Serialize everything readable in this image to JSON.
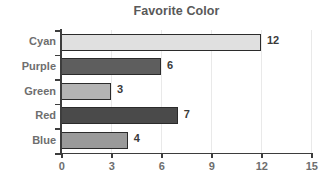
{
  "chart_data": {
    "type": "bar",
    "orientation": "horizontal",
    "title": "Favorite Color",
    "xlabel": "",
    "ylabel": "",
    "categories": [
      "Cyan",
      "Purple",
      "Green",
      "Red",
      "Blue"
    ],
    "values": [
      12,
      6,
      3,
      7,
      4
    ],
    "value_labels": [
      "12",
      "6",
      "3",
      "7",
      "4"
    ],
    "bar_colors": [
      "#e0e0e0",
      "#5e5e5e",
      "#b4b4b4",
      "#4a4a4a",
      "#9a9a9a"
    ],
    "bar_edge_color": "#2b2b2b",
    "xlim": [
      0,
      15
    ],
    "xticks": [
      0,
      3,
      6,
      9,
      12,
      15
    ],
    "xtick_labels": [
      "0",
      "3",
      "6",
      "9",
      "12",
      "15"
    ],
    "grid": true,
    "grid_axis": "x",
    "grid_color": "#e9e9e9",
    "legend": false,
    "background": "#ffffff",
    "title_color": "#595959",
    "tick_label_color": "#6e6e6e",
    "axis_color": "#3d3d3d"
  }
}
